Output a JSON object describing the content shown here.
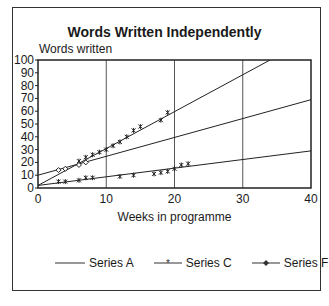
{
  "chart_data": {
    "type": "scatter",
    "title": "Words Written Independently",
    "xlabel": "Weeks in programme",
    "ylabel": "Words written",
    "xlim": [
      0,
      40
    ],
    "ylim": [
      0,
      100
    ],
    "x_ticks": [
      "0",
      "10",
      "20",
      "30",
      "40"
    ],
    "y_ticks": [
      "0",
      "10",
      "20",
      "30",
      "40",
      "50",
      "60",
      "70",
      "80",
      "90",
      "100"
    ],
    "grid": "vertical lines at x=10,20,30",
    "legend_position": "bottom",
    "trend_lines": [
      {
        "name": "upper",
        "x": [
          0,
          34
        ],
        "y": [
          2,
          100
        ]
      },
      {
        "name": "middle",
        "x": [
          0,
          40
        ],
        "y": [
          10,
          69
        ]
      },
      {
        "name": "lower",
        "x": [
          0,
          40
        ],
        "y": [
          2,
          29
        ]
      }
    ],
    "series": [
      {
        "name": "Series A",
        "marker": "none",
        "x": [
          0,
          40
        ],
        "y": [
          10,
          69
        ]
      },
      {
        "name": "Series C",
        "marker": "asterisk",
        "x": [
          3,
          4,
          6,
          7,
          8,
          12,
          14,
          17,
          18,
          19,
          20,
          21,
          22,
          6,
          7,
          8,
          9,
          10,
          11,
          12,
          13,
          14,
          15,
          18,
          19
        ],
        "y": [
          5,
          5,
          6,
          8,
          8,
          9,
          10,
          11,
          12,
          13,
          15,
          18,
          19,
          21,
          24,
          26,
          28,
          30,
          33,
          36,
          40,
          45,
          48,
          53,
          59
        ]
      },
      {
        "name": "Series F",
        "marker": "diamond",
        "x": [
          3,
          4,
          6,
          7
        ],
        "y": [
          14,
          15,
          18,
          20
        ]
      }
    ]
  },
  "labels": {
    "title": "Words Written Independently",
    "ylabel": "Words written",
    "xlabel": "Weeks in programme",
    "legend": [
      "Series A",
      "Series C",
      "Series F"
    ]
  }
}
